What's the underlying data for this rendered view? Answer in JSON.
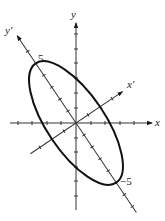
{
  "diagram": {
    "axes": {
      "x_label": "x",
      "y_label": "y",
      "x_prime_label": "x′",
      "y_prime_label": "y′"
    },
    "annotations": {
      "upper_vertex_label": "5",
      "lower_vertex_label": "−5"
    },
    "geometry": {
      "origin": [
        76,
        123
      ],
      "unit_px": 14.5,
      "ellipse_semi_major_px": 72,
      "ellipse_semi_minor_px": 29,
      "rotation_deg": -34
    },
    "colors": {
      "stroke": "#1a1a1a",
      "background": "#ffffff"
    }
  }
}
